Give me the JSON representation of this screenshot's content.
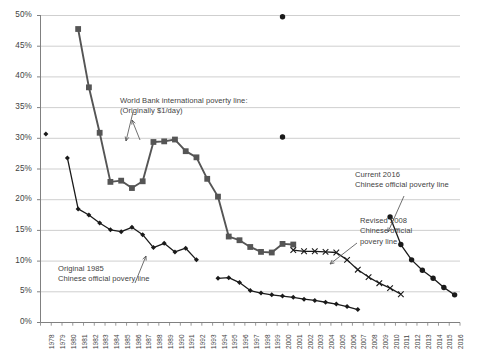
{
  "chart_data": {
    "type": "line",
    "title": "",
    "xlabel": "",
    "ylabel": "",
    "ylim": [
      0,
      0.5
    ],
    "ytick_labels": [
      "0%",
      "5%",
      "10%",
      "15%",
      "20%",
      "25%",
      "30%",
      "35%",
      "40%",
      "45%",
      "50%"
    ],
    "ytick_values": [
      0,
      5,
      10,
      15,
      20,
      25,
      30,
      35,
      40,
      45,
      50
    ],
    "grid": true,
    "legend": "none",
    "x": [
      1978,
      1979,
      1980,
      1981,
      1982,
      1983,
      1984,
      1985,
      1986,
      1987,
      1988,
      1989,
      1990,
      1991,
      1992,
      1993,
      1994,
      1995,
      1996,
      1997,
      1998,
      1999,
      2000,
      2001,
      2002,
      2003,
      2004,
      2005,
      2006,
      2007,
      2008,
      2009,
      2010,
      2011,
      2012,
      2013,
      2014,
      2015,
      2016
    ],
    "xtick_labels": [
      "1978",
      "1979",
      "1980",
      "1981",
      "1982",
      "1983",
      "1984",
      "1985",
      "1986",
      "1987",
      "1988",
      "1989",
      "1990",
      "1991",
      "1992",
      "1993",
      "1994",
      "1995",
      "1996",
      "1997",
      "1998",
      "1999",
      "2000",
      "2001",
      "2002",
      "2003",
      "2004",
      "2005",
      "2006",
      "2007",
      "2008",
      "2009",
      "2010",
      "2011",
      "2012",
      "2013",
      "2014",
      "2015",
      "2016"
    ],
    "series": [
      {
        "name": "Original 1985 Chinese official poverty line",
        "marker": "diamond",
        "color": "#1a1a1a",
        "points": [
          {
            "x": 1978,
            "y": 30.7,
            "isolated": true
          },
          {
            "x": 1980,
            "y": 26.8
          },
          {
            "x": 1981,
            "y": 18.5
          },
          {
            "x": 1982,
            "y": 17.5
          },
          {
            "x": 1983,
            "y": 16.2
          },
          {
            "x": 1984,
            "y": 15.1
          },
          {
            "x": 1985,
            "y": 14.8
          },
          {
            "x": 1986,
            "y": 15.5
          },
          {
            "x": 1987,
            "y": 14.3
          },
          {
            "x": 1988,
            "y": 12.2
          },
          {
            "x": 1989,
            "y": 12.9
          },
          {
            "x": 1990,
            "y": 11.5
          },
          {
            "x": 1991,
            "y": 12.1
          },
          {
            "x": 1992,
            "y": 10.2
          },
          {
            "x": 1994,
            "y": 7.2
          },
          {
            "x": 1995,
            "y": 7.3
          },
          {
            "x": 1996,
            "y": 6.5
          },
          {
            "x": 1997,
            "y": 5.2
          },
          {
            "x": 1998,
            "y": 4.8
          },
          {
            "x": 1999,
            "y": 4.5
          },
          {
            "x": 2000,
            "y": 4.3
          },
          {
            "x": 2001,
            "y": 4.1
          },
          {
            "x": 2002,
            "y": 3.8
          },
          {
            "x": 2003,
            "y": 3.6
          },
          {
            "x": 2004,
            "y": 3.3
          },
          {
            "x": 2005,
            "y": 3.0
          },
          {
            "x": 2006,
            "y": 2.6
          },
          {
            "x": 2007,
            "y": 2.1
          }
        ]
      },
      {
        "name": "World Bank international poverty line (Originally $1/day)",
        "marker": "square",
        "color": "#555555",
        "points": [
          {
            "x": 1981,
            "y": 47.8
          },
          {
            "x": 1982,
            "y": 38.3
          },
          {
            "x": 1983,
            "y": 30.9
          },
          {
            "x": 1984,
            "y": 22.9
          },
          {
            "x": 1985,
            "y": 23.1
          },
          {
            "x": 1986,
            "y": 21.9
          },
          {
            "x": 1987,
            "y": 23.0
          },
          {
            "x": 1988,
            "y": 29.4
          },
          {
            "x": 1989,
            "y": 29.5
          },
          {
            "x": 1990,
            "y": 29.8
          },
          {
            "x": 1991,
            "y": 27.9
          },
          {
            "x": 1992,
            "y": 26.9
          },
          {
            "x": 1993,
            "y": 23.4
          },
          {
            "x": 1994,
            "y": 20.5
          },
          {
            "x": 1995,
            "y": 14.0
          },
          {
            "x": 1996,
            "y": 13.4
          },
          {
            "x": 1997,
            "y": 12.3
          },
          {
            "x": 1998,
            "y": 11.5
          },
          {
            "x": 1999,
            "y": 11.4
          },
          {
            "x": 2000,
            "y": 12.8
          },
          {
            "x": 2001,
            "y": 12.7
          }
        ]
      },
      {
        "name": "Revised 2008 Chinese official poverty line",
        "marker": "x",
        "color": "#1a1a1a",
        "points": [
          {
            "x": 2001,
            "y": 11.8
          },
          {
            "x": 2002,
            "y": 11.6
          },
          {
            "x": 2003,
            "y": 11.6
          },
          {
            "x": 2004,
            "y": 11.5
          },
          {
            "x": 2005,
            "y": 11.4
          },
          {
            "x": 2006,
            "y": 10.2
          },
          {
            "x": 2007,
            "y": 8.6
          },
          {
            "x": 2008,
            "y": 7.4
          },
          {
            "x": 2009,
            "y": 6.4
          },
          {
            "x": 2010,
            "y": 5.6
          },
          {
            "x": 2011,
            "y": 4.6
          }
        ]
      },
      {
        "name": "Current 2016 Chinese official poverty line",
        "marker": "circle",
        "color": "#1a1a1a",
        "points": [
          {
            "x": 2010,
            "y": 17.2
          },
          {
            "x": 2011,
            "y": 12.7
          },
          {
            "x": 2012,
            "y": 10.2
          },
          {
            "x": 2013,
            "y": 8.5
          },
          {
            "x": 2014,
            "y": 7.2
          },
          {
            "x": 2015,
            "y": 5.7
          },
          {
            "x": 2016,
            "y": 4.5
          }
        ]
      },
      {
        "name": "isolated points",
        "marker": "circle",
        "color": "#1a1a1a",
        "points": [
          {
            "x": 2000,
            "y": 49.8,
            "isolated": true
          },
          {
            "x": 2000,
            "y": 30.2,
            "isolated": true
          }
        ]
      }
    ],
    "annotations": [
      {
        "id": "world-bank",
        "lines": [
          "World Bank international poverty line:",
          "(Originally $1/day)"
        ],
        "x": 120,
        "y": 96
      },
      {
        "id": "original-1985",
        "lines": [
          "Original 1985",
          "Chinese official povery line"
        ],
        "x": 58,
        "y": 264
      },
      {
        "id": "revised-2008",
        "lines": [
          "Revised 2008",
          "Chinese official",
          "povery line"
        ],
        "x": 360,
        "y": 216
      },
      {
        "id": "current-2016",
        "lines": [
          "Current 2016",
          "Chinese official poverty line"
        ],
        "x": 355,
        "y": 170
      }
    ],
    "colors": {
      "grid": "#c9c9c9",
      "axis": "#808080",
      "series_dark": "#1a1a1a",
      "series_gray": "#555555",
      "text": "#3f3f3f",
      "background": "#ffffff"
    }
  }
}
